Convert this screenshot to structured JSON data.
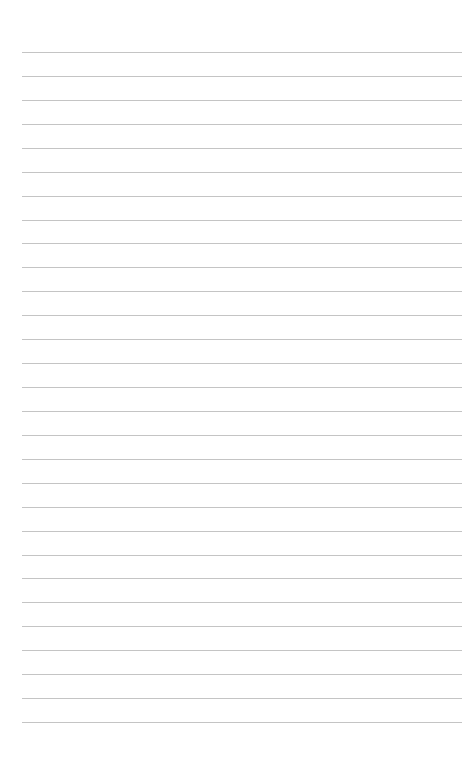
{
  "page": {
    "type": "lined-paper",
    "background": "#ffffff",
    "line_color": "#c4c4c4",
    "line_count": 29,
    "first_line_y": 52,
    "line_spacing": 23.93,
    "line_left": 22,
    "line_right": 462
  }
}
